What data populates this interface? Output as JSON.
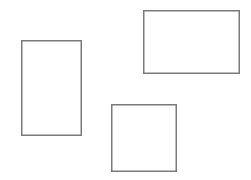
{
  "canvas": {
    "width": 251,
    "height": 180,
    "background_color": "#ffffff",
    "title": "Rectangles Diagram"
  },
  "style": {
    "stroke_color": "#7a7a7a",
    "stroke_width": 1.5,
    "fill": "none"
  },
  "shapes": [
    {
      "id": "rect-vertical-left",
      "name": "vertical-rectangle",
      "type": "rectangle",
      "x": 21,
      "y": 40,
      "width": 61,
      "height": 96,
      "stroke_color": "#7a7a7a",
      "stroke_width": 1.5,
      "fill": "none"
    },
    {
      "id": "rect-wide-top-right",
      "name": "wide-rectangle",
      "type": "rectangle",
      "x": 143,
      "y": 10,
      "width": 97,
      "height": 64,
      "stroke_color": "#7a7a7a",
      "stroke_width": 1.5,
      "fill": "none"
    },
    {
      "id": "rect-square-bottom-center",
      "name": "square",
      "type": "rectangle",
      "x": 111,
      "y": 104,
      "width": 66,
      "height": 68,
      "stroke_color": "#7a7a7a",
      "stroke_width": 1.5,
      "fill": "none"
    }
  ]
}
